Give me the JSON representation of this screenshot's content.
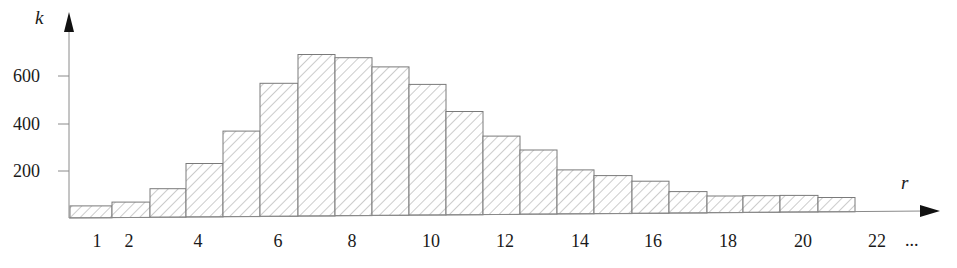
{
  "chart_data": {
    "type": "bar",
    "title": "",
    "xlabel": "r",
    "ylabel": "k",
    "categories": [
      "1",
      "2",
      "3",
      "4",
      "5",
      "6",
      "7",
      "8",
      "9",
      "10",
      "11",
      "12",
      "13",
      "14",
      "15",
      "16",
      "17",
      "18",
      "19",
      "20",
      "21"
    ],
    "values": [
      50,
      65,
      120,
      225,
      360,
      560,
      680,
      665,
      625,
      550,
      435,
      330,
      270,
      185,
      160,
      135,
      90,
      70,
      70,
      70,
      60
    ],
    "ylim": [
      0,
      700
    ],
    "yticks": [
      200,
      400,
      600
    ],
    "xtick_labels": [
      "1",
      "2",
      "4",
      "6",
      "8",
      "10",
      "12",
      "14",
      "16",
      "18",
      "20",
      "22"
    ],
    "x_continuation": "...",
    "grid": false,
    "legend": null,
    "bar_style": "diagonal hatch",
    "colors": {
      "bar_stroke": "#7a7a7a",
      "hatch": "#9a9a9a",
      "axis": "#8a8a8a",
      "text": "#1a1a1a"
    }
  },
  "axes": {
    "y_label": "k",
    "x_label": "r",
    "y_ticks": [
      "600",
      "400",
      "200"
    ],
    "x_ticks": [
      "1",
      "2",
      "4",
      "6",
      "8",
      "10",
      "12",
      "14",
      "16",
      "18",
      "20",
      "22"
    ],
    "x_ellipsis": "..."
  }
}
